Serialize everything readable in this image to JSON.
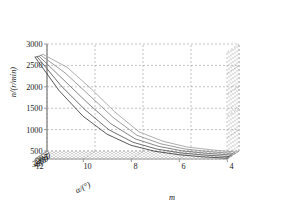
{
  "figure": {
    "background_color": "#ffffff",
    "plot_type": "3d-line-mesh",
    "grid_color": "#9a9a9a",
    "axis_color": "#8c8c8c"
  },
  "chart_data": {
    "type": "line",
    "title": "",
    "projection": "3d",
    "xlabel": "m",
    "ylabel": "α/(°)",
    "zlabel": "n/(r/min)",
    "xlim": [
      12,
      4
    ],
    "ylim": [
      30,
      0
    ],
    "zlim": [
      500,
      3000
    ],
    "xticks": [
      12,
      10,
      8,
      6,
      4
    ],
    "xticklabels": [
      "12",
      "10",
      "8",
      "6",
      "4"
    ],
    "yticks": [
      30,
      25,
      20,
      15,
      10,
      5,
      0
    ],
    "yticklabels": [
      "30",
      "25",
      "20",
      "15",
      "10",
      "5",
      "0"
    ],
    "zticks": [
      500,
      1000,
      1500,
      2000,
      2500,
      3000
    ],
    "zticklabels": [
      "500",
      "1000",
      "1500",
      "2000",
      "2500",
      "3000"
    ],
    "grid": true,
    "legend": null,
    "series": [
      {
        "name": "alpha-30",
        "color": "#3b3b3b",
        "alpha": 30,
        "x": [
          12,
          11,
          10,
          9,
          8,
          7,
          6,
          5,
          4
        ],
        "z": [
          2880,
          2100,
          1500,
          1080,
          820,
          680,
          600,
          550,
          520
        ]
      },
      {
        "name": "alpha-25",
        "color": "#555555",
        "alpha": 25,
        "x": [
          12,
          11,
          10,
          9,
          8,
          7,
          6,
          5,
          4
        ],
        "z": [
          2860,
          2180,
          1620,
          1150,
          860,
          700,
          610,
          560,
          525
        ]
      },
      {
        "name": "alpha-20",
        "color": "#6e6e6e",
        "alpha": 20,
        "x": [
          12,
          11,
          10,
          9,
          8,
          7,
          6,
          5,
          4
        ],
        "z": [
          2840,
          2300,
          1760,
          1260,
          910,
          730,
          625,
          570,
          530
        ]
      },
      {
        "name": "alpha-15",
        "color": "#8a8a8a",
        "alpha": 15,
        "x": [
          12,
          11,
          10,
          9,
          8,
          7,
          6,
          5,
          4
        ],
        "z": [
          2830,
          2420,
          1900,
          1380,
          960,
          760,
          640,
          580,
          535
        ]
      },
      {
        "name": "alpha-10",
        "color": "#9e9e9e",
        "alpha": 10,
        "x": [
          12,
          11,
          10,
          9,
          8,
          7,
          6,
          5,
          4
        ],
        "z": [
          2820,
          2520,
          2020,
          1470,
          1010,
          790,
          655,
          590,
          540
        ]
      }
    ]
  }
}
